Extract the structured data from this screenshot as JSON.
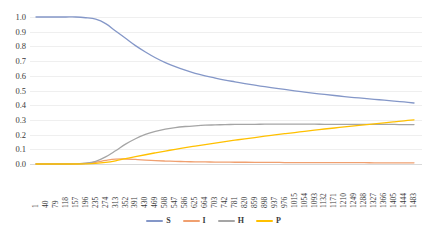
{
  "chart_data": {
    "type": "line",
    "title": "",
    "xlabel": "",
    "ylabel": "",
    "ylim": [
      0.0,
      1.0
    ],
    "grid": true,
    "legend_position": "bottom",
    "y_ticks": [
      "0.0",
      "0.1",
      "0.2",
      "0.3",
      "0.4",
      "0.5",
      "0.6",
      "0.7",
      "0.8",
      "0.9",
      "1.0"
    ],
    "y_tick_values": [
      0.0,
      0.1,
      0.2,
      0.3,
      0.4,
      0.5,
      0.6,
      0.7,
      0.8,
      0.9,
      1.0
    ],
    "x_tick_labels": [
      "1",
      "40",
      "79",
      "118",
      "157",
      "196",
      "235",
      "274",
      "313",
      "352",
      "391",
      "430",
      "469",
      "508",
      "547",
      "586",
      "625",
      "664",
      "703",
      "742",
      "781",
      "820",
      "859",
      "898",
      "937",
      "976",
      "1015",
      "1054",
      "1093",
      "1132",
      "1171",
      "1210",
      "1249",
      "1288",
      "1327",
      "1366",
      "1405",
      "1444",
      "1483"
    ],
    "x_tick_values": [
      1,
      40,
      79,
      118,
      157,
      196,
      235,
      274,
      313,
      352,
      391,
      430,
      469,
      508,
      547,
      586,
      625,
      664,
      703,
      742,
      781,
      820,
      859,
      898,
      937,
      976,
      1015,
      1054,
      1093,
      1132,
      1171,
      1210,
      1249,
      1288,
      1327,
      1366,
      1405,
      1444,
      1483
    ],
    "x_range": [
      1,
      1483
    ],
    "legend": [
      "S",
      "I",
      "H",
      "P"
    ],
    "colors": {
      "S": "#8497C8",
      "I": "#F0A070",
      "H": "#A5A5A5",
      "P": "#FFC000"
    },
    "series": [
      {
        "name": "S",
        "color": "#8497C8",
        "x": [
          1,
          40,
          79,
          118,
          157,
          196,
          235,
          274,
          313,
          352,
          391,
          430,
          469,
          508,
          547,
          586,
          625,
          664,
          703,
          742,
          781,
          820,
          859,
          898,
          937,
          976,
          1015,
          1054,
          1093,
          1132,
          1171,
          1210,
          1249,
          1288,
          1327,
          1366,
          1405,
          1444,
          1483
        ],
        "values": [
          1.0,
          1.0,
          1.0,
          1.0,
          1.0,
          0.995,
          0.985,
          0.955,
          0.905,
          0.855,
          0.805,
          0.762,
          0.723,
          0.69,
          0.662,
          0.638,
          0.617,
          0.6,
          0.585,
          0.571,
          0.559,
          0.547,
          0.536,
          0.526,
          0.516,
          0.507,
          0.498,
          0.489,
          0.481,
          0.473,
          0.466,
          0.459,
          0.452,
          0.446,
          0.44,
          0.434,
          0.428,
          0.422,
          0.415
        ]
      },
      {
        "name": "I",
        "color": "#F0A070",
        "x": [
          1,
          40,
          79,
          118,
          157,
          196,
          235,
          274,
          313,
          352,
          391,
          430,
          469,
          508,
          547,
          586,
          625,
          664,
          703,
          742,
          781,
          820,
          859,
          898,
          937,
          976,
          1015,
          1054,
          1093,
          1132,
          1171,
          1210,
          1249,
          1288,
          1327,
          1366,
          1405,
          1444,
          1483
        ],
        "values": [
          0.0,
          0.0,
          0.0,
          0.0,
          0.001,
          0.004,
          0.012,
          0.024,
          0.033,
          0.034,
          0.031,
          0.027,
          0.023,
          0.02,
          0.018,
          0.016,
          0.015,
          0.014,
          0.013,
          0.013,
          0.012,
          0.012,
          0.011,
          0.011,
          0.011,
          0.01,
          0.01,
          0.01,
          0.01,
          0.009,
          0.009,
          0.009,
          0.009,
          0.009,
          0.008,
          0.008,
          0.008,
          0.008,
          0.008
        ]
      },
      {
        "name": "H",
        "color": "#A5A5A5",
        "x": [
          1,
          40,
          79,
          118,
          157,
          196,
          235,
          274,
          313,
          352,
          391,
          430,
          469,
          508,
          547,
          586,
          625,
          664,
          703,
          742,
          781,
          820,
          859,
          898,
          937,
          976,
          1015,
          1054,
          1093,
          1132,
          1171,
          1210,
          1249,
          1288,
          1327,
          1366,
          1405,
          1444,
          1483
        ],
        "values": [
          0.0,
          0.0,
          0.0,
          0.0,
          0.001,
          0.005,
          0.018,
          0.048,
          0.09,
          0.135,
          0.172,
          0.201,
          0.222,
          0.237,
          0.248,
          0.255,
          0.26,
          0.264,
          0.266,
          0.268,
          0.269,
          0.27,
          0.27,
          0.271,
          0.271,
          0.271,
          0.271,
          0.271,
          0.271,
          0.27,
          0.27,
          0.27,
          0.27,
          0.269,
          0.269,
          0.269,
          0.269,
          0.268,
          0.268
        ]
      },
      {
        "name": "P",
        "color": "#FFC000",
        "x": [
          1,
          40,
          79,
          118,
          157,
          196,
          235,
          274,
          313,
          352,
          391,
          430,
          469,
          508,
          547,
          586,
          625,
          664,
          703,
          742,
          781,
          820,
          859,
          898,
          937,
          976,
          1015,
          1054,
          1093,
          1132,
          1171,
          1210,
          1249,
          1288,
          1327,
          1366,
          1405,
          1444,
          1483
        ],
        "values": [
          0.0,
          0.0,
          0.0,
          0.0,
          0.0,
          0.001,
          0.004,
          0.011,
          0.022,
          0.036,
          0.05,
          0.063,
          0.076,
          0.088,
          0.1,
          0.111,
          0.122,
          0.132,
          0.142,
          0.152,
          0.162,
          0.171,
          0.18,
          0.189,
          0.198,
          0.206,
          0.214,
          0.222,
          0.23,
          0.238,
          0.245,
          0.252,
          0.259,
          0.266,
          0.273,
          0.28,
          0.287,
          0.294,
          0.3
        ]
      }
    ]
  }
}
